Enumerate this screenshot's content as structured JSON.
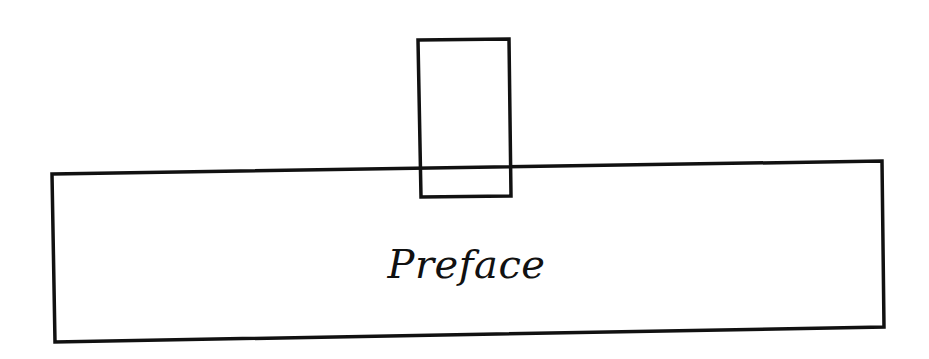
{
  "diagram": {
    "label": "Preface",
    "stroke_color": "#111111",
    "background_color": "#ffffff",
    "shapes": [
      {
        "name": "preface-box",
        "type": "quadrilateral",
        "points": [
          [
            52,
            174
          ],
          [
            882,
            161
          ],
          [
            884,
            327
          ],
          [
            55,
            342
          ]
        ]
      },
      {
        "name": "tab-box",
        "type": "quadrilateral",
        "points": [
          [
            418,
            40
          ],
          [
            509,
            39
          ],
          [
            511,
            196
          ],
          [
            421,
            197
          ]
        ]
      }
    ]
  }
}
